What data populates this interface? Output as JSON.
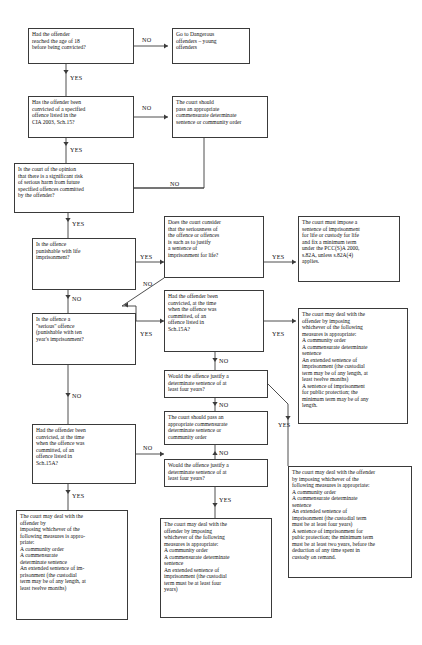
{
  "diagram": {
    "line_color": "#3a3a3a",
    "text_color": "#121212",
    "background": "#ffffff",
    "nodes": [
      {
        "id": "q_age18",
        "kind": "decision",
        "text": "Had the offender\nreached the age of 18\nbefore being convicted?",
        "x": 28,
        "y": 28,
        "w": 106,
        "h": 36,
        "font": 5.6
      },
      {
        "id": "out_young",
        "kind": "terminal",
        "text": "Go to Dangerous\noffenders – young\noffenders",
        "x": 172,
        "y": 28,
        "w": 78,
        "h": 36,
        "font": 5.6
      },
      {
        "id": "q_sch15",
        "kind": "decision",
        "text": "Has the offender been\nconvicted of a specified\noffence listed in the\nCIA 2003, Sch.15?",
        "x": 28,
        "y": 96,
        "w": 106,
        "h": 42,
        "font": 5.6
      },
      {
        "id": "out_commensurate_top",
        "kind": "terminal",
        "text": "The court should\npass an appropriate\ncommensurate determinate\nsentence or community order",
        "x": 172,
        "y": 96,
        "w": 96,
        "h": 42,
        "font": 5.6
      },
      {
        "id": "q_risk",
        "kind": "decision",
        "text": "Is the court of the opinion\nthat there is a significant risk\nof serious harm from future\nspecified offences committed\nby the offender?",
        "x": 14,
        "y": 163,
        "w": 120,
        "h": 50,
        "font": 5.6
      },
      {
        "id": "q_life",
        "kind": "decision",
        "text": "Is the offence\npunishable with life\nimprisonment?",
        "x": 32,
        "y": 238,
        "w": 104,
        "h": 52,
        "font": 5.6
      },
      {
        "id": "q_serious_life",
        "kind": "decision",
        "text": "Does the court consider\nthat the seriousness of\nthe offence or offences\nis such as to justify\na sentence of\nimprisonment for life?",
        "x": 164,
        "y": 216,
        "w": 100,
        "h": 62,
        "font": 5.6
      },
      {
        "id": "out_life_must",
        "kind": "terminal",
        "text": "The court must impose a\nsentence of imprisonment\nfor life or custody for life\nand fix a minimum term\nunder the PCC(S)A 2000,\ns.82A, unless s.82A(4)\napplies.",
        "x": 298,
        "y": 216,
        "w": 102,
        "h": 66,
        "font": 5.6
      },
      {
        "id": "q_sch15a_mid",
        "kind": "decision",
        "text": "Had the offender been\nconvicted, at the time\nwhen the offence was\ncommitted, of an\noffence listed in\nSch.15A?",
        "x": 164,
        "y": 290,
        "w": 100,
        "h": 62,
        "font": 5.6
      },
      {
        "id": "out_measures_twelve",
        "kind": "terminal",
        "text": "The court may deal with the\noffender by imposing\nwhichever of the following\nmeasures is appropriate:\nA community order\nA commensurate determinate\nsentence\nAn extended sentence of\nimprisonment (the custodial\nterm may be of any length, at\nleast twelve months)\nA sentence of imprisonment\nfor public protection; the\nminimum term may be of any\nlength.",
        "x": 298,
        "y": 308,
        "w": 110,
        "h": 116,
        "font": 5.6
      },
      {
        "id": "q_serious_ten",
        "kind": "decision",
        "text": "Is the offence a\n\"serious\" offence\n(punishable with ten\nyear's imprisonment?",
        "x": 32,
        "y": 313,
        "w": 104,
        "h": 52,
        "font": 5.6
      },
      {
        "id": "q_four_years_top",
        "kind": "decision",
        "text": "Would the offence justify a\ndeterminate sentence of at\nleast four years?",
        "x": 164,
        "y": 370,
        "w": 104,
        "h": 28,
        "font": 5.6
      },
      {
        "id": "out_commensurate_mid",
        "kind": "terminal",
        "text": "The court should pass an\nappropriate commensurate\ndeterminate sentence or\ncommunity order",
        "x": 164,
        "y": 411,
        "w": 104,
        "h": 34,
        "font": 5.6
      },
      {
        "id": "q_sch15a_left",
        "kind": "decision",
        "text": "Had the offender been\nconvicted, at the time\nwhen the offence was\ncommitted, of an\noffence listed in\nSch.15A?",
        "x": 32,
        "y": 424,
        "w": 104,
        "h": 60,
        "font": 5.6
      },
      {
        "id": "q_four_years_bot",
        "kind": "decision",
        "text": "Would the offence justify a\ndeterminate sentence of at\nleast four years?",
        "x": 164,
        "y": 459,
        "w": 104,
        "h": 28,
        "font": 5.6
      },
      {
        "id": "out_four_years_public",
        "kind": "terminal",
        "text": "The court may deal with the offender\nby imposing whichever of the\nfollowing measures is appropriate:\nA community order\nA commensurate determinate\nsentence\nAn extended sentence of\nimprisonment (the custodial term\nmust be at least four years)\nA sentence of imprisonment for\npubic protection; the minimum term\nmust be at least two years, before the\ndeduction of any time spent in\ncustody on remand.",
        "x": 288,
        "y": 466,
        "w": 124,
        "h": 112,
        "font": 5.6
      },
      {
        "id": "out_left_twelve",
        "kind": "terminal",
        "text": "The court may deal with the\noffender by\nimposing whichever of the\nfollowing measures is appro-\npriate:\nA community order\nA commensurate\ndeterminate sentence\nAn extended sentence of im-\nprisonment (the custodial\nterm may be of any length, at\nleast twelve months)",
        "x": 16,
        "y": 510,
        "w": 112,
        "h": 110,
        "font": 5.6
      },
      {
        "id": "out_mid_four",
        "kind": "terminal",
        "text": "The court may deal with the\noffender by imposing\nwhichever of the following\nmeasures is appropriate:\nA community order\nA commensurate determinate\nsentence\nAn extended sentence of\nimprisonment (the custodial\nterm must be at least four\nyears)",
        "x": 160,
        "y": 518,
        "w": 112,
        "h": 100,
        "font": 5.6
      }
    ],
    "edge_labels": [
      {
        "id": "lbl_no_age18",
        "text": "NO",
        "x": 142,
        "y": 36,
        "font": 6.2
      },
      {
        "id": "lbl_yes_age18",
        "text": "YES",
        "x": 70,
        "y": 74,
        "font": 6.2
      },
      {
        "id": "lbl_no_sch15",
        "text": "NO",
        "x": 142,
        "y": 104,
        "font": 6.2
      },
      {
        "id": "lbl_yes_sch15",
        "text": "YES",
        "x": 70,
        "y": 146,
        "font": 6.2
      },
      {
        "id": "lbl_no_risk",
        "text": "NO",
        "x": 170,
        "y": 180,
        "font": 6.2
      },
      {
        "id": "lbl_yes_risk",
        "text": "YES",
        "x": 72,
        "y": 220,
        "font": 6.2
      },
      {
        "id": "lbl_yes_life",
        "text": "YES",
        "x": 140,
        "y": 253,
        "font": 6.2
      },
      {
        "id": "lbl_yes_serious_life",
        "text": "YES",
        "x": 272,
        "y": 253,
        "font": 6.2
      },
      {
        "id": "lbl_no_serious_life",
        "text": "NO",
        "x": 143,
        "y": 280,
        "font": 6.2
      },
      {
        "id": "lbl_no_life",
        "text": "NO",
        "x": 72,
        "y": 295,
        "font": 6.2
      },
      {
        "id": "lbl_yes_serious_ten",
        "text": "YES",
        "x": 140,
        "y": 330,
        "font": 6.2
      },
      {
        "id": "lbl_yes_sch15a_mid",
        "text": "YES",
        "x": 272,
        "y": 330,
        "font": 6.2
      },
      {
        "id": "lbl_no_sch15a_mid",
        "text": "NO",
        "x": 219,
        "y": 357,
        "font": 6.2
      },
      {
        "id": "lbl_no_serious_ten",
        "text": "NO",
        "x": 72,
        "y": 392,
        "font": 6.2
      },
      {
        "id": "lbl_no_four_top",
        "text": "NO",
        "x": 219,
        "y": 401,
        "font": 6.2
      },
      {
        "id": "lbl_no_commensurate",
        "text": "NO",
        "x": 219,
        "y": 449,
        "font": 6.2
      },
      {
        "id": "lbl_no_sch15a_left",
        "text": "NO",
        "x": 143,
        "y": 444,
        "font": 6.2
      },
      {
        "id": "lbl_yes_sch15a_left",
        "text": "YES",
        "x": 72,
        "y": 492,
        "font": 6.2
      },
      {
        "id": "lbl_yes_four_bot",
        "text": "YES",
        "x": 219,
        "y": 496,
        "font": 6.2
      },
      {
        "id": "lbl_yes_four_right",
        "text": "YES",
        "x": 278,
        "y": 421,
        "font": 6.2
      }
    ],
    "connectors": [
      {
        "id": "e_age18_no",
        "path": "M134,46 L168,46",
        "arrow": "right",
        "arrow_at": "168,46"
      },
      {
        "id": "e_age18_yes",
        "path": "M66,64 L66,96",
        "arrow": "down",
        "arrow_at": "66,74"
      },
      {
        "id": "e_sch15_no",
        "path": "M134,117 L168,117",
        "arrow": "right",
        "arrow_at": "168,117"
      },
      {
        "id": "e_sch15_yes",
        "path": "M66,138 L66,163",
        "arrow": "down",
        "arrow_at": "66,146"
      },
      {
        "id": "e_commensurate_down",
        "path": "M204,138 L204,188 L122,188",
        "arrow": "left",
        "arrow_at": "122,188"
      },
      {
        "id": "e_risk_no",
        "path": "M134,188 L204,188",
        "arrow": "none",
        "arrow_at": ""
      },
      {
        "id": "e_risk_yes",
        "path": "M68,213 L68,238",
        "arrow": "down",
        "arrow_at": "68,222"
      },
      {
        "id": "e_life_yes",
        "path": "M136,262 L164,262",
        "arrow": "right",
        "arrow_at": "164,262"
      },
      {
        "id": "e_serious_life_yes",
        "path": "M264,262 L296,262",
        "arrow": "right",
        "arrow_at": "296,262"
      },
      {
        "id": "e_serious_life_no",
        "path": "M164,278 L122,306",
        "arrow": "left",
        "arrow_at": "124,305"
      },
      {
        "id": "e_life_no",
        "path": "M68,290 L68,313",
        "arrow": "down",
        "arrow_at": "68,299"
      },
      {
        "id": "e_serious_ten_yes",
        "path": "M136,321 L164,321",
        "arrow": "right",
        "arrow_at": "164,321"
      },
      {
        "id": "e_serious_ten_to_diag",
        "path": "M122,306 L136,306 L136,321",
        "arrow": "none",
        "arrow_at": ""
      },
      {
        "id": "e_sch15a_mid_yes",
        "path": "M264,321 L296,321",
        "arrow": "right",
        "arrow_at": "296,321"
      },
      {
        "id": "e_sch15a_mid_no",
        "path": "M215,352 L215,370",
        "arrow": "down",
        "arrow_at": "215,362"
      },
      {
        "id": "e_four_top_no",
        "path": "M215,398 L215,411",
        "arrow": "down",
        "arrow_at": "215,406"
      },
      {
        "id": "e_serious_ten_no",
        "path": "M68,365 L68,424",
        "arrow": "down",
        "arrow_at": "68,397"
      },
      {
        "id": "e_sch15a_left_no",
        "path": "M136,454 L164,454",
        "arrow": "right",
        "arrow_at": "164,454"
      },
      {
        "id": "e_commensurate_no",
        "path": "M215,445 L215,459",
        "arrow": "up",
        "arrow_at": "215,451"
      },
      {
        "id": "e_sch15a_left_yes",
        "path": "M68,484 L68,510",
        "arrow": "down",
        "arrow_at": "68,494"
      },
      {
        "id": "e_four_bot_yes",
        "path": "M215,487 L215,518",
        "arrow": "down",
        "arrow_at": "215,507"
      },
      {
        "id": "e_four_top_yes",
        "path": "M268,384 L288,404 L288,466",
        "arrow": "down",
        "arrow_at": "288,420"
      }
    ]
  }
}
